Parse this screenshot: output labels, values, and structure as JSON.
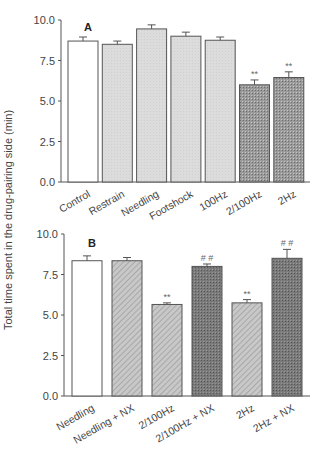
{
  "y_axis_label": "Total time spent in the drug-pairing side (min)",
  "chart_data": [
    {
      "type": "bar",
      "panel": "A",
      "title": "A",
      "xlabel": "",
      "ylabel": "Total time spent in the drug-pairing side (min)",
      "ylim": [
        0,
        10
      ],
      "yticks": [
        "0.0",
        "2.5",
        "5.0",
        "7.5",
        "10.0"
      ],
      "grid": false,
      "categories": [
        "Control",
        "Restrain",
        "Needling",
        "Footshock",
        "100Hz",
        "2/100Hz",
        "2Hz"
      ],
      "values": [
        8.7,
        8.5,
        9.45,
        9.0,
        8.75,
        6.0,
        6.45
      ],
      "errors": [
        0.25,
        0.2,
        0.25,
        0.25,
        0.2,
        0.3,
        0.35
      ],
      "annotations": [
        "",
        "",
        "",
        "",
        "",
        "**",
        "**"
      ],
      "fills": [
        "white",
        "light",
        "light",
        "light",
        "light",
        "hatch-dark",
        "hatch-dark"
      ]
    },
    {
      "type": "bar",
      "panel": "B",
      "title": "B",
      "xlabel": "",
      "ylabel": "Total time spent in the drug-pairing side (min)",
      "ylim": [
        0,
        10
      ],
      "yticks": [
        "0.0",
        "2.5",
        "5.0",
        "7.5",
        "10.0"
      ],
      "grid": false,
      "categories": [
        "Needling",
        "Needling + NX",
        "2/100Hz",
        "2/100Hz + NX",
        "2Hz",
        "2Hz + NX"
      ],
      "values": [
        8.35,
        8.35,
        5.65,
        8.0,
        5.75,
        8.5
      ],
      "errors": [
        0.3,
        0.2,
        0.1,
        0.15,
        0.2,
        0.55
      ],
      "annotations": [
        "",
        "",
        "**",
        "# #",
        "**",
        "# #"
      ],
      "fills": [
        "white",
        "hatch-light",
        "hatch-light",
        "hatch-darker",
        "hatch-light",
        "hatch-darker"
      ]
    }
  ]
}
